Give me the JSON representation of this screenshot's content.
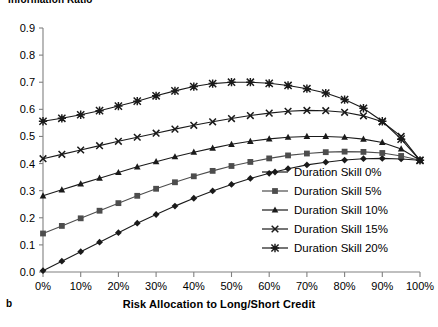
{
  "chart_data": {
    "type": "line",
    "title": "Information Ratio",
    "panel_label": "b",
    "xlabel": "Risk Allocation to Long/Short Credit",
    "ylabel": "Information Ratio",
    "xlim": [
      0,
      100
    ],
    "ylim": [
      0.0,
      0.9
    ],
    "grid": false,
    "legend_position": "right-inside",
    "x_tick_labels": [
      "0%",
      "10%",
      "20%",
      "30%",
      "40%",
      "50%",
      "60%",
      "70%",
      "80%",
      "90%",
      "100%"
    ],
    "x_ticks": [
      0,
      10,
      20,
      30,
      40,
      50,
      60,
      70,
      80,
      90,
      100
    ],
    "y_tick_labels": [
      "0.0",
      "0.1",
      "0.2",
      "0.3",
      "0.4",
      "0.5",
      "0.6",
      "0.7",
      "0.8",
      "0.9"
    ],
    "y_ticks": [
      0.0,
      0.1,
      0.2,
      0.3,
      0.4,
      0.5,
      0.6,
      0.7,
      0.8,
      0.9
    ],
    "x": [
      0,
      5,
      10,
      15,
      20,
      25,
      30,
      35,
      40,
      45,
      50,
      55,
      60,
      65,
      70,
      75,
      80,
      85,
      90,
      95,
      100
    ],
    "series": [
      {
        "name": "Duration Skill 0%",
        "marker": "diamond",
        "color": "#1a1a1a",
        "values": [
          0.005,
          0.04,
          0.075,
          0.11,
          0.145,
          0.18,
          0.212,
          0.243,
          0.272,
          0.299,
          0.323,
          0.345,
          0.364,
          0.381,
          0.395,
          0.405,
          0.413,
          0.418,
          0.419,
          0.417,
          0.412
        ]
      },
      {
        "name": "Duration Skill 5%",
        "marker": "square",
        "color": "#4d4d4d",
        "values": [
          0.142,
          0.17,
          0.198,
          0.226,
          0.254,
          0.281,
          0.307,
          0.331,
          0.353,
          0.373,
          0.391,
          0.406,
          0.419,
          0.43,
          0.437,
          0.442,
          0.444,
          0.443,
          0.439,
          0.428,
          0.412
        ]
      },
      {
        "name": "Duration Skill 10%",
        "marker": "triangle",
        "color": "#1a1a1a",
        "values": [
          0.281,
          0.303,
          0.325,
          0.346,
          0.367,
          0.388,
          0.407,
          0.425,
          0.442,
          0.457,
          0.471,
          0.482,
          0.491,
          0.497,
          0.5,
          0.5,
          0.497,
          0.49,
          0.478,
          0.454,
          0.412
        ]
      },
      {
        "name": "Duration Skill 15%",
        "marker": "x",
        "color": "#1a1a1a",
        "values": [
          0.418,
          0.434,
          0.45,
          0.466,
          0.482,
          0.497,
          0.512,
          0.527,
          0.541,
          0.554,
          0.566,
          0.577,
          0.586,
          0.593,
          0.596,
          0.595,
          0.589,
          0.576,
          0.554,
          0.5,
          0.412
        ]
      },
      {
        "name": "Duration Skill 20%",
        "marker": "asterisk",
        "color": "#1a1a1a",
        "values": [
          0.556,
          0.567,
          0.58,
          0.595,
          0.612,
          0.63,
          0.65,
          0.668,
          0.684,
          0.695,
          0.7,
          0.7,
          0.696,
          0.688,
          0.676,
          0.66,
          0.636,
          0.604,
          0.556,
          0.49,
          0.412
        ]
      }
    ]
  },
  "legend": {
    "items": [
      {
        "label": "Duration Skill 0%"
      },
      {
        "label": "Duration Skill 5%"
      },
      {
        "label": "Duration Skill 10%"
      },
      {
        "label": "Duration Skill 15%"
      },
      {
        "label": "Duration Skill 20%"
      }
    ]
  }
}
